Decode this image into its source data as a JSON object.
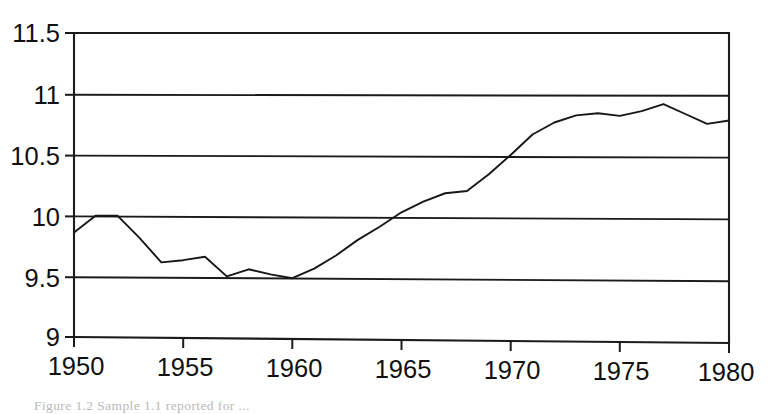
{
  "figure": {
    "caption": "Figure 1.2  Sample 1.1 reported for ...",
    "background_color": "#ffffff",
    "line_color": "#171717",
    "axis_color": "#1b1b1b"
  },
  "chart_data": {
    "type": "line",
    "title": "",
    "xlabel": "",
    "ylabel": "",
    "xlim": [
      1950,
      1980
    ],
    "ylim": [
      9,
      11.5
    ],
    "grid": true,
    "legend": false,
    "x_ticks": [
      1950,
      1955,
      1960,
      1965,
      1970,
      1975,
      1980
    ],
    "x_tick_labels": [
      "1950",
      "1955",
      "1960",
      "1965",
      "1970",
      "1975",
      "1980"
    ],
    "y_ticks": [
      9,
      9.5,
      10,
      10.5,
      11,
      11.5
    ],
    "y_tick_labels": [
      "9",
      "9.5",
      "10",
      "10.5",
      "11",
      "11.5"
    ],
    "series": [
      {
        "name": "series-1",
        "x": [
          1950,
          1951,
          1952,
          1953,
          1954,
          1955,
          1956,
          1957,
          1958,
          1959,
          1960,
          1961,
          1962,
          1963,
          1964,
          1965,
          1966,
          1967,
          1968,
          1969,
          1970,
          1971,
          1972,
          1973,
          1974,
          1975,
          1976,
          1977,
          1978,
          1979,
          1980
        ],
        "values": [
          9.86,
          10.0,
          10.0,
          9.82,
          9.62,
          9.64,
          9.67,
          9.51,
          9.57,
          9.53,
          9.5,
          9.58,
          9.69,
          9.82,
          9.93,
          10.05,
          10.14,
          10.21,
          10.23,
          10.37,
          10.53,
          10.7,
          10.8,
          10.86,
          10.88,
          10.86,
          10.9,
          10.96,
          10.88,
          10.8,
          10.83
        ]
      }
    ]
  }
}
